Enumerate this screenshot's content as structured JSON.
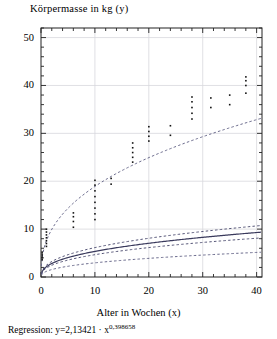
{
  "chart_data": {
    "type": "scatter",
    "title": "Körpermasse in kg (y)",
    "xlabel": "Alter in Wochen (x)",
    "ylabel": "Körpermasse in kg (y)",
    "caption_prefix": "Regression: y=2,13421 · x",
    "caption_exponent": "0,398658",
    "regression": {
      "coefficient": 2.13421,
      "exponent": 0.398658,
      "formula": "y=2,13421 · x^0,398658"
    },
    "xlim": [
      0,
      41
    ],
    "ylim": [
      0,
      52
    ],
    "xticks": [
      0,
      10,
      20,
      30,
      40
    ],
    "yticks": [
      0,
      10,
      20,
      30,
      40,
      50
    ],
    "xtick_labels": [
      "0",
      "10",
      "20",
      "30",
      "40"
    ],
    "ytick_labels": [
      "0",
      "10",
      "20",
      "30",
      "40",
      "50"
    ],
    "minor_tick_step": 2,
    "grid": true,
    "legend": null,
    "series": [
      {
        "name": "Regression",
        "style": "solid",
        "color": "#3a3a5c",
        "curve": {
          "a": 2.13421,
          "b": 0.398658
        }
      },
      {
        "name": "Oberes Konfidenzband",
        "style": "dashed",
        "color": "#555577",
        "curve": {
          "a": 2.45,
          "b": 0.398658
        }
      },
      {
        "name": "Unteres Konfidenzband",
        "style": "dashed",
        "color": "#555577",
        "curve": {
          "a": 1.86,
          "b": 0.398658
        }
      },
      {
        "name": "Oberes Prognoseband",
        "style": "dashed",
        "color": "#6a6a8c",
        "curve": {
          "a": 7.55,
          "b": 0.398658
        }
      },
      {
        "name": "Unteres Prognoseband",
        "style": "dashed",
        "color": "#6a6a8c",
        "curve": {
          "a": 1.18,
          "b": 0.398658
        }
      }
    ],
    "scatter_points": [
      {
        "x": 0.2,
        "y": 3.6
      },
      {
        "x": 0.2,
        "y": 4.0
      },
      {
        "x": 0.2,
        "y": 4.4
      },
      {
        "x": 0.2,
        "y": 4.8
      },
      {
        "x": 0.2,
        "y": 5.2
      },
      {
        "x": 1.0,
        "y": 6.4
      },
      {
        "x": 1.0,
        "y": 7.0
      },
      {
        "x": 1.0,
        "y": 7.6
      },
      {
        "x": 1.0,
        "y": 8.2
      },
      {
        "x": 1.0,
        "y": 8.8
      },
      {
        "x": 1.0,
        "y": 9.4
      },
      {
        "x": 1.0,
        "y": 10.0
      },
      {
        "x": 6.0,
        "y": 10.4
      },
      {
        "x": 6.0,
        "y": 11.6
      },
      {
        "x": 6.0,
        "y": 12.6
      },
      {
        "x": 6.0,
        "y": 13.4
      },
      {
        "x": 10.0,
        "y": 12.0
      },
      {
        "x": 10.0,
        "y": 13.2
      },
      {
        "x": 10.0,
        "y": 14.4
      },
      {
        "x": 10.0,
        "y": 15.6
      },
      {
        "x": 10.0,
        "y": 16.8
      },
      {
        "x": 10.0,
        "y": 18.0
      },
      {
        "x": 10.0,
        "y": 19.2
      },
      {
        "x": 10.0,
        "y": 20.2
      },
      {
        "x": 13.0,
        "y": 19.4
      },
      {
        "x": 13.0,
        "y": 20.6
      },
      {
        "x": 17.0,
        "y": 24.0
      },
      {
        "x": 17.0,
        "y": 25.0
      },
      {
        "x": 17.0,
        "y": 26.0
      },
      {
        "x": 17.0,
        "y": 27.0
      },
      {
        "x": 17.0,
        "y": 28.0
      },
      {
        "x": 20.0,
        "y": 28.4
      },
      {
        "x": 20.0,
        "y": 29.4
      },
      {
        "x": 20.0,
        "y": 30.4
      },
      {
        "x": 20.0,
        "y": 31.4
      },
      {
        "x": 24.0,
        "y": 29.6
      },
      {
        "x": 24.0,
        "y": 31.6
      },
      {
        "x": 28.0,
        "y": 33.0
      },
      {
        "x": 28.0,
        "y": 34.2
      },
      {
        "x": 28.0,
        "y": 35.4
      },
      {
        "x": 28.0,
        "y": 36.6
      },
      {
        "x": 28.0,
        "y": 37.6
      },
      {
        "x": 31.5,
        "y": 35.4
      },
      {
        "x": 31.5,
        "y": 37.4
      },
      {
        "x": 35.0,
        "y": 36.0
      },
      {
        "x": 35.0,
        "y": 38.0
      },
      {
        "x": 38.0,
        "y": 38.4
      },
      {
        "x": 38.0,
        "y": 40.0
      },
      {
        "x": 38.0,
        "y": 41.0
      },
      {
        "x": 38.0,
        "y": 41.8
      }
    ]
  }
}
